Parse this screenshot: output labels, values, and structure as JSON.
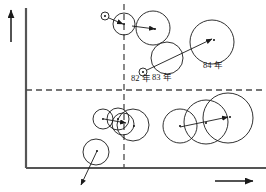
{
  "figure": {
    "type": "bubble-trajectory-matrix",
    "background_color": "#ffffff",
    "stroke_color": "#1a1a1a",
    "axis_color": "#555555",
    "dash_color": "#4a4a4a"
  },
  "axes": {
    "y_axis": {
      "name": "vertical-axis",
      "x": 26,
      "y_top": 8,
      "y_bottom": 168
    },
    "x_axis": {
      "name": "horizontal-axis",
      "y": 168,
      "x_left": 26,
      "x_right": 266
    },
    "y_axis_arrow": {
      "name": "y-axis-direction-arrow",
      "x": 11,
      "y_top": 8,
      "y_bottom": 42
    },
    "x_axis_arrow": {
      "name": "x-axis-direction-arrow",
      "y": 181,
      "x_left": 215,
      "x_right": 255
    }
  },
  "dividers": {
    "horizontal_dashed": {
      "y": 90,
      "x_start": 26,
      "x_end": 264
    },
    "vertical_dashed": {
      "x": 124,
      "y_start": 4,
      "y_end": 168
    }
  },
  "labels": [
    {
      "id": "label-82",
      "text": "82 年",
      "x": 131,
      "y": 71
    },
    {
      "id": "label-83",
      "text": "83 年",
      "x": 152,
      "y": 70
    },
    {
      "id": "label-84",
      "text": "84 年",
      "x": 203,
      "y": 58
    }
  ],
  "trajectories": [
    {
      "id": "trajectory-upper-left",
      "quadrant": "top",
      "circles": [
        {
          "cx": 105,
          "cy": 16,
          "r": 4
        },
        {
          "cx": 124,
          "cy": 24,
          "r": 11
        },
        {
          "cx": 153,
          "cy": 28,
          "r": 17
        }
      ],
      "arrows": [
        {
          "x1": 109,
          "y1": 18,
          "x2": 123,
          "y2": 24
        },
        {
          "x1": 132,
          "y1": 26,
          "x2": 155,
          "y2": 29
        }
      ],
      "centers": [
        {
          "cx": 105,
          "cy": 16
        },
        {
          "cx": 124,
          "cy": 24
        },
        {
          "cx": 155,
          "cy": 29
        }
      ]
    },
    {
      "id": "trajectory-upper-right",
      "quadrant": "top",
      "circles": [
        {
          "cx": 143,
          "cy": 72,
          "r": 4
        },
        {
          "cx": 167,
          "cy": 58,
          "r": 16
        },
        {
          "cx": 212,
          "cy": 42,
          "r": 22
        }
      ],
      "arrows": [
        {
          "x1": 147,
          "y1": 70,
          "x2": 212,
          "y2": 39
        }
      ],
      "centers": [
        {
          "cx": 143,
          "cy": 72
        },
        {
          "cx": 214,
          "cy": 40
        }
      ]
    },
    {
      "id": "trajectory-lower-left",
      "quadrant": "bottom",
      "circles": [
        {
          "cx": 103,
          "cy": 119,
          "r": 10
        },
        {
          "cx": 118,
          "cy": 119,
          "r": 11
        },
        {
          "cx": 123,
          "cy": 124,
          "r": 11
        },
        {
          "cx": 133,
          "cy": 125,
          "r": 16
        }
      ],
      "arrows": [
        {
          "x1": 104,
          "y1": 119,
          "x2": 126,
          "y2": 123
        }
      ],
      "centers": [
        {
          "cx": 103,
          "cy": 119
        },
        {
          "cx": 118,
          "cy": 119
        },
        {
          "cx": 134,
          "cy": 126
        }
      ]
    },
    {
      "id": "trajectory-lower-right",
      "quadrant": "bottom",
      "circles": [
        {
          "cx": 180,
          "cy": 126,
          "r": 17
        },
        {
          "cx": 206,
          "cy": 122,
          "r": 22
        },
        {
          "cx": 228,
          "cy": 118,
          "r": 25
        }
      ],
      "arrows": [
        {
          "x1": 180,
          "y1": 127,
          "x2": 228,
          "y2": 117
        }
      ],
      "centers": [
        {
          "cx": 180,
          "cy": 126
        },
        {
          "cx": 206,
          "cy": 123
        },
        {
          "cx": 230,
          "cy": 117
        }
      ]
    },
    {
      "id": "trajectory-declining",
      "quadrant": "bottom",
      "circles": [
        {
          "cx": 96,
          "cy": 152,
          "r": 13
        }
      ],
      "arrows": [
        {
          "x1": 97,
          "y1": 151,
          "x2": 81,
          "y2": 185
        }
      ],
      "centers": [
        {
          "cx": 97,
          "cy": 151
        }
      ]
    }
  ]
}
